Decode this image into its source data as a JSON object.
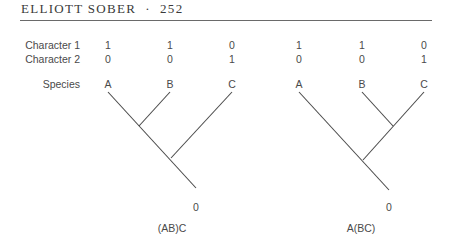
{
  "header": {
    "running_head": "ELLIOTT SOBER  ·  252"
  },
  "rows": {
    "character1": {
      "label": "Character 1",
      "values": [
        "1",
        "1",
        "0",
        "1",
        "1",
        "0"
      ]
    },
    "character2": {
      "label": "Character 2",
      "values": [
        "0",
        "0",
        "1",
        "0",
        "0",
        "1"
      ]
    },
    "species": {
      "label": "Species",
      "values": [
        "A",
        "B",
        "C",
        "A",
        "B",
        "C"
      ]
    }
  },
  "trees": [
    {
      "root_state": "0",
      "caption": "(AB)C"
    },
    {
      "root_state": "0",
      "caption": "A(BC)"
    }
  ]
}
